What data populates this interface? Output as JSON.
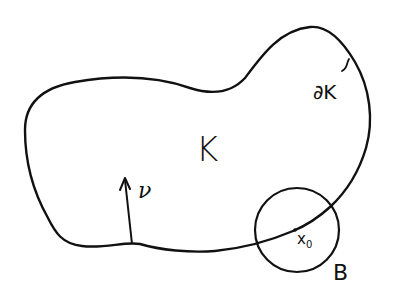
{
  "diagram": {
    "style": "hand-drawn line sketch",
    "stroke_color": "#111111",
    "background": "#ffffff",
    "labels": {
      "set": "K",
      "boundary": "∂K",
      "normal": "ν",
      "point": "x",
      "point_sub": "0",
      "ball": "B"
    },
    "elements": [
      {
        "type": "closed-curve",
        "label": "K",
        "description": "bean-shaped region"
      },
      {
        "type": "boundary",
        "label": "∂K",
        "description": "boundary of K with small tick marker"
      },
      {
        "type": "arrow",
        "label": "ν",
        "description": "normal vector pointing into K from bottom boundary"
      },
      {
        "type": "circle",
        "label": "B",
        "description": "ball centered at boundary point x0"
      },
      {
        "type": "point",
        "label": "x0",
        "description": "point on boundary at center of ball B"
      }
    ]
  }
}
